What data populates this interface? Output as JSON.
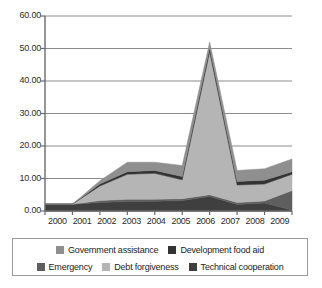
{
  "chart_data": {
    "type": "area",
    "title": "",
    "xlabel": "",
    "ylabel": "",
    "stacked": true,
    "grid": true,
    "legend_position": "bottom",
    "ylim": [
      0,
      60
    ],
    "yticks": [
      "0.00",
      "10.00",
      "20.00",
      "30.00",
      "40.00",
      "50.00",
      "60.00"
    ],
    "ytick_values": [
      0,
      10,
      20,
      30,
      40,
      50,
      60
    ],
    "categories": [
      "2000",
      "2001",
      "2002",
      "2003",
      "2004",
      "2005",
      "2006",
      "2007",
      "2008",
      "2009"
    ],
    "series": [
      {
        "name": "Technical cooperation",
        "color": "#3f3f3f",
        "values": [
          2.1,
          2.1,
          2.6,
          2.9,
          3.0,
          3.2,
          4.5,
          2.0,
          2.5,
          0.3
        ]
      },
      {
        "name": "Emergency",
        "color": "#5e5e5e",
        "values": [
          0.0,
          0.0,
          0.6,
          0.7,
          0.6,
          0.6,
          0.5,
          0.6,
          0.6,
          6.0
        ]
      },
      {
        "name": "Debt forgiveness",
        "color": "#b5b5b5",
        "values": [
          0.0,
          0.0,
          4.5,
          7.7,
          8.0,
          5.8,
          44.0,
          5.4,
          5.2,
          5.0
        ]
      },
      {
        "name": "Development food aid",
        "color": "#333333",
        "values": [
          0.0,
          0.0,
          0.6,
          0.8,
          0.9,
          1.0,
          1.2,
          1.1,
          1.2,
          0.8
        ]
      },
      {
        "name": "Government assistance",
        "color": "#8f8f8f",
        "values": [
          0.0,
          0.0,
          1.0,
          2.9,
          2.5,
          3.4,
          1.8,
          3.4,
          3.5,
          3.9
        ]
      }
    ],
    "totals": [
      2.1,
      2.1,
      9.3,
      15.0,
      15.0,
      14.0,
      52.0,
      12.5,
      13.0,
      16.0
    ]
  },
  "axes": {
    "axis_color": "#6b6b6b",
    "grid_color": "#8c8c8c"
  },
  "legend": {
    "border_color": "#9a9a9a",
    "rows": [
      [
        {
          "label": "Government assistance",
          "color": "#8f8f8f"
        },
        {
          "label": "Development food aid",
          "color": "#333333"
        }
      ],
      [
        {
          "label": "Emergency",
          "color": "#5e5e5e"
        },
        {
          "label": "Debt forgiveness",
          "color": "#b5b5b5"
        },
        {
          "label": "Technical cooperation",
          "color": "#3f3f3f"
        }
      ]
    ]
  }
}
